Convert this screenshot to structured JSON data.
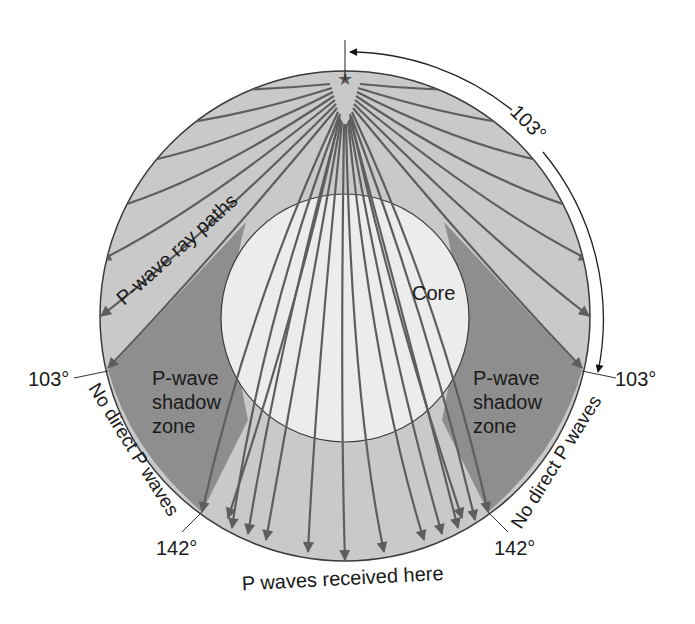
{
  "diagram": {
    "title": "P-wave shadow zone",
    "colors": {
      "mantle": "#c9c9c9",
      "shadow": "#8e8e8e",
      "core": "#ececec",
      "ray": "#5e5e5e",
      "outline": "#3a3a3a",
      "text": "#1a1a1a"
    },
    "labels": {
      "epicenter_arc_angle": "103°",
      "left_103": "103°",
      "right_103": "103°",
      "left_142": "142°",
      "right_142": "142°",
      "ray_paths": "P-wave ray paths",
      "core": "Core",
      "shadow_left_line1": "P-wave",
      "shadow_left_line2": "shadow",
      "shadow_left_line3": "zone",
      "shadow_right_line1": "P-wave",
      "shadow_right_line2": "shadow",
      "shadow_right_line3": "zone",
      "no_direct_left": "No direct P waves",
      "no_direct_right": "No direct P waves",
      "received_here": "P waves received here"
    },
    "icons": {
      "epicenter": "star-icon"
    }
  }
}
